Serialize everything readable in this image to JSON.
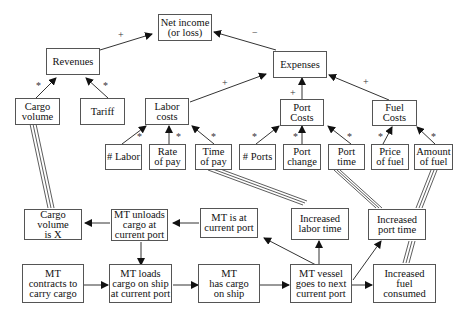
{
  "nodes": {
    "net_income": "Net income\n(or loss)",
    "revenues": "Revenues",
    "expenses": "Expenses",
    "cargo_volume": "Cargo\nvolume",
    "tariff": "Tariff",
    "labor_costs": "Labor\ncosts",
    "port_costs": "Port\nCosts",
    "fuel_costs": "Fuel\nCosts",
    "num_labor": "# Labor",
    "rate_of_pay": "Rate\nof pay",
    "time_of_pay": "Time\nof pay",
    "num_ports": "# Ports",
    "port_change": "Port\nchange",
    "port_time": "Port\ntime",
    "price_of_fuel": "Price\nof fuel",
    "amount_of_fuel": "Amount\nof fuel",
    "cargo_volume_x": "Cargo\nvolume\nis X",
    "mt_unloads": "MT unloads\ncargo at\ncurrent port",
    "mt_at_port": "MT is at\ncurrent port",
    "increased_labor_time": "Increased\nlabor time",
    "increased_port_time": "Increased\nport time",
    "mt_contracts": "MT\ncontracts to\ncarry cargo",
    "mt_loads": "MT loads\ncargo on ship\nat current port",
    "mt_has_cargo": "MT\nhas cargo\non ship",
    "mt_vessel_goes": "MT vessel\ngoes to next\ncurrent port",
    "increased_fuel": "Increased\nfuel\nconsumed"
  },
  "signs": {
    "revenues_to_net": "+",
    "expenses_to_net": "−",
    "labor_to_expenses": "+",
    "port_to_expenses": "+",
    "fuel_to_expenses": "+",
    "star": "*"
  }
}
